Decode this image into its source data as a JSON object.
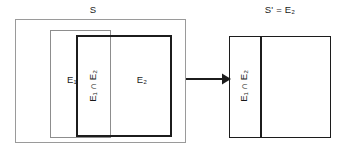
{
  "diagram": {
    "title_left": "S",
    "title_right": "S' = E₂",
    "left_panel": {
      "name": "sample-space-s",
      "outer_label": "S",
      "sets": [
        {
          "id": "e1",
          "label": "E₁",
          "label_plain": "E1"
        },
        {
          "id": "e2",
          "label": "E₂",
          "label_plain": "E2"
        },
        {
          "id": "e1-cap-e2",
          "label": "E₁ ∩ E₂",
          "label_plain": "E1 intersect E2",
          "orientation": "vertical"
        }
      ]
    },
    "right_panel": {
      "name": "reduced-sample-space",
      "outer_label": "S' = E₂",
      "sets": [
        {
          "id": "e1-cap-e2-right",
          "label": "E₁ ∩ E₂",
          "label_plain": "E1 intersect E2",
          "orientation": "vertical"
        }
      ]
    },
    "arrow": {
      "name": "transformation-arrow",
      "direction": "right",
      "label": ""
    },
    "colors": {
      "background": "#ffffff",
      "stroke_dark": "#1c1c1c",
      "stroke_light": "#9a9a9a",
      "text": "#1a1a1a"
    }
  }
}
